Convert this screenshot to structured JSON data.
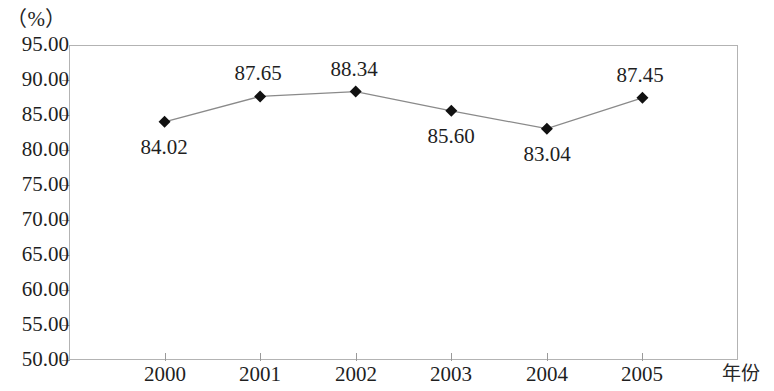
{
  "chart_data": {
    "type": "line",
    "title": "",
    "subtitle": "",
    "xlabel": "年份",
    "ylabel": "（%）",
    "categories": [
      "2000",
      "2001",
      "2002",
      "2003",
      "2004",
      "2005"
    ],
    "values": [
      84.02,
      87.65,
      88.34,
      85.6,
      83.04,
      87.45
    ],
    "series": [
      {
        "name": "",
        "values": [
          84.02,
          87.65,
          88.34,
          85.6,
          83.04,
          87.45
        ],
        "marker": "diamond",
        "marker_color": "#111111",
        "line_color": "#8a8a8a"
      }
    ],
    "point_labels": [
      "84.02",
      "87.65",
      "88.34",
      "85.60",
      "83.04",
      "87.45"
    ],
    "point_label_positions": [
      "below",
      "above",
      "above",
      "below",
      "below",
      "above"
    ],
    "ylim": [
      50.0,
      95.0
    ],
    "ytick_values": [
      95.0,
      90.0,
      85.0,
      80.0,
      75.0,
      70.0,
      65.0,
      60.0,
      55.0,
      50.0
    ],
    "ytick_labels": [
      "95.00",
      "90.00",
      "85.00",
      "80.00",
      "75.00",
      "70.00",
      "65.00",
      "60.00",
      "55.00",
      "50.00"
    ],
    "grid": false,
    "legend": null,
    "legend_position": "none",
    "frame_color": "#b3b3b3",
    "background_color": "#ffffff"
  },
  "axes": {
    "unit_label": "（%）",
    "x_axis_title": "年份"
  }
}
